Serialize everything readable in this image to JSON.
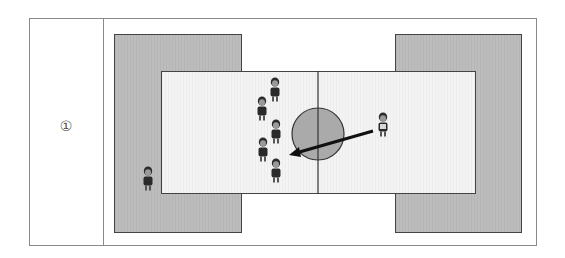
{
  "diagram": {
    "label": "①",
    "colors": {
      "outer_border": "#8a8a8a",
      "outer_zone": "#bababa",
      "court": "#f0f0f0",
      "circle": "#aaaaaa",
      "line": "#222222"
    },
    "center_circle": {
      "cx": 318,
      "cy": 134,
      "r": 26
    },
    "pass_arrow": {
      "from": [
        373,
        131
      ],
      "to": [
        290,
        155
      ]
    },
    "players_left_team": [
      {
        "x": 275,
        "y": 91
      },
      {
        "x": 262,
        "y": 110
      },
      {
        "x": 276,
        "y": 133
      },
      {
        "x": 263,
        "y": 151
      },
      {
        "x": 276,
        "y": 172
      }
    ],
    "player_right": {
      "x": 383,
      "y": 126
    },
    "player_outside": {
      "x": 148,
      "y": 180
    }
  }
}
